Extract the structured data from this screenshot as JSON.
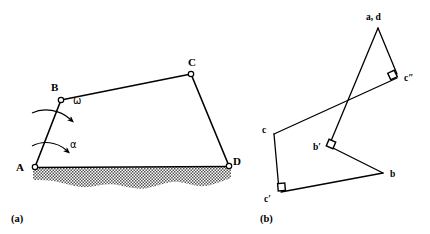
{
  "figure": {
    "background_color": "#ffffff",
    "stroke_color": "#000000",
    "panels": [
      {
        "caption": "(a)",
        "caption_pos": [
          14,
          219
        ],
        "type": "four-bar-linkage-mechanism",
        "joints": [
          {
            "label": "A",
            "label_pos": [
              16,
              171
            ],
            "x": 35,
            "y": 167,
            "kind": "ground-pivot"
          },
          {
            "label": "B",
            "label_pos": [
              53,
              91
            ],
            "x": 61,
            "y": 100,
            "kind": "pin-joint"
          },
          {
            "label": "C",
            "label_pos": [
              189,
              66
            ],
            "x": 191,
            "y": 74,
            "kind": "pin-joint"
          },
          {
            "label": "D",
            "label_pos": [
              232,
              163
            ],
            "x": 229,
            "y": 166,
            "kind": "ground-pivot"
          }
        ],
        "links": [
          {
            "name": "link-AB",
            "from": "A",
            "to": "B"
          },
          {
            "name": "link-BC",
            "from": "B",
            "to": "C"
          },
          {
            "name": "link-CD",
            "from": "C",
            "to": "D"
          }
        ],
        "ground": {
          "name": "ground-hatch",
          "line_from": [
            33,
            167
          ],
          "line_to": [
            231,
            166
          ],
          "fill_texture": "stipple-checker",
          "texture_color": "#4a4a4a"
        },
        "motion_arrows": [
          {
            "symbol": "ω",
            "name": "omega",
            "label_pos": [
              74,
              101
            ],
            "arc_from": [
              33,
              113
            ],
            "arc_to": [
              83,
              129
            ]
          },
          {
            "symbol": "α",
            "name": "alpha",
            "label_pos": [
              70,
              145
            ],
            "arc_from": [
              33,
              146
            ],
            "arc_to": [
              79,
              159
            ]
          }
        ]
      },
      {
        "caption": "(b)",
        "caption_pos": [
          263,
          219
        ],
        "type": "velocity-acceleration-polygon",
        "nodes": [
          {
            "label": "a, d",
            "name": "node-ad",
            "label_pos": [
              368,
              17
            ],
            "x": 378,
            "y": 26
          },
          {
            "label": "c″",
            "name": "node-c2",
            "label_pos": [
              406,
              76
            ],
            "x": 396,
            "y": 78
          },
          {
            "label": "c",
            "name": "node-c",
            "label_pos": [
              263,
              130
            ],
            "x": 274,
            "y": 134
          },
          {
            "label": "b′",
            "name": "node-b1",
            "label_pos": [
              315,
              148
            ],
            "x": 330,
            "y": 145
          },
          {
            "label": "b",
            "name": "node-b",
            "label_pos": [
              391,
              172
            ],
            "x": 383,
            "y": 173
          },
          {
            "label": "c′",
            "name": "node-c1",
            "label_pos": [
              265,
              198
            ],
            "x": 279,
            "y": 193
          }
        ],
        "edges": [
          {
            "name": "edge-ad-c2",
            "from": "a, d",
            "to": "c″"
          },
          {
            "name": "edge-c2-c",
            "from": "c″",
            "to": "c"
          },
          {
            "name": "edge-ad-b1",
            "from": "a, d",
            "to": "b′"
          },
          {
            "name": "edge-b1-b",
            "from": "b′",
            "to": "b"
          },
          {
            "name": "edge-c-c1",
            "from": "c",
            "to": "c′"
          },
          {
            "name": "edge-c1-b",
            "from": "c′",
            "to": "b"
          }
        ],
        "right_angle_markers": [
          {
            "name": "right-angle-c2",
            "at": "c″"
          },
          {
            "name": "right-angle-b1",
            "at": "b′"
          },
          {
            "name": "right-angle-c1",
            "at": "c′"
          }
        ]
      }
    ]
  }
}
